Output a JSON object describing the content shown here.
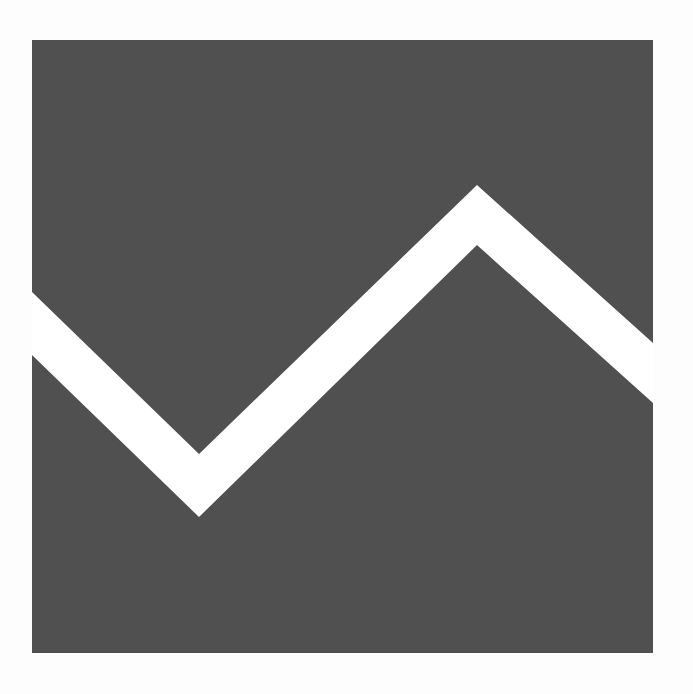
{
  "graphic": {
    "description": "logo-mark",
    "background_color": "#fdfdfd",
    "square_color": "#505050",
    "band_color": "#ffffff",
    "square": {
      "x": 32,
      "y": 40,
      "width": 621,
      "height": 613
    },
    "band_top_edge": [
      [
        32,
        292
      ],
      [
        199,
        454
      ],
      [
        477,
        185
      ],
      [
        653,
        343
      ]
    ],
    "band_bottom_edge": [
      [
        653,
        403
      ],
      [
        477,
        245
      ],
      [
        199,
        517
      ],
      [
        32,
        355
      ]
    ]
  }
}
